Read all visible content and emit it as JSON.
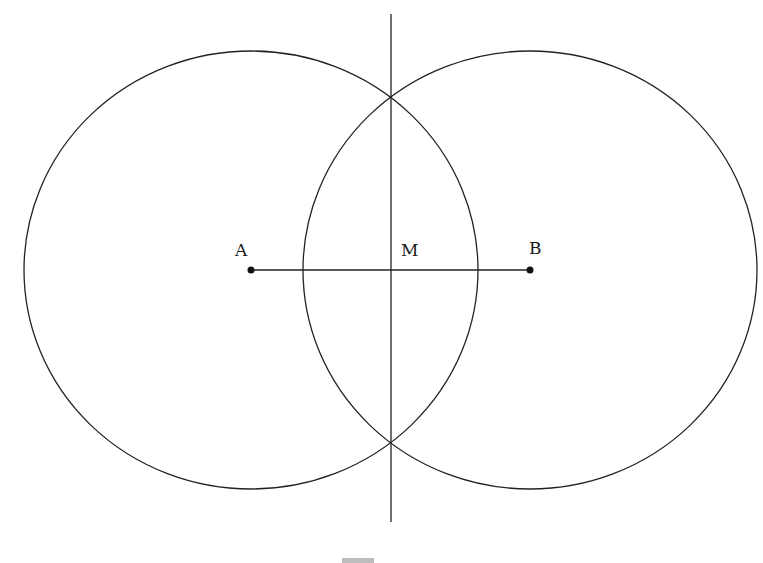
{
  "diagram": {
    "type": "perpendicular-bisector-construction",
    "points": {
      "A": {
        "label": "A",
        "x": 251,
        "y": 270
      },
      "B": {
        "label": "B",
        "x": 530,
        "y": 270
      },
      "M": {
        "label": "M",
        "x": 391,
        "y": 270
      }
    },
    "circles": [
      {
        "center": "A",
        "cx": 251,
        "cy": 270,
        "rx": 227,
        "ry": 219
      },
      {
        "center": "B",
        "cx": 530,
        "cy": 270,
        "rx": 227,
        "ry": 219
      }
    ],
    "segment_AB": {
      "x1": 251,
      "y1": 270,
      "x2": 530,
      "y2": 270
    },
    "bisector_line": {
      "x": 391,
      "y1": 14,
      "y2": 522
    },
    "intersections": [
      {
        "x": 391,
        "y": 96
      },
      {
        "x": 391,
        "y": 440
      }
    ],
    "stroke_color": "#222222"
  }
}
